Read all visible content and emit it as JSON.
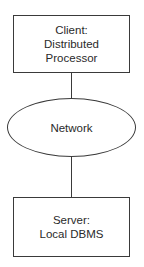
{
  "diagram": {
    "nodes": [
      {
        "id": "client",
        "shape": "rectangle",
        "lines": [
          "Client:",
          "Distributed",
          "Processor"
        ]
      },
      {
        "id": "network",
        "shape": "ellipse",
        "lines": [
          "Network"
        ]
      },
      {
        "id": "server",
        "shape": "rectangle",
        "lines": [
          "Server:",
          "Local DBMS"
        ]
      }
    ],
    "edges": [
      {
        "from": "client",
        "to": "network"
      },
      {
        "from": "network",
        "to": "server"
      }
    ],
    "colors": {
      "stroke": "#3a3a3a",
      "text": "#2a2a2a",
      "background": "#ffffff"
    }
  }
}
